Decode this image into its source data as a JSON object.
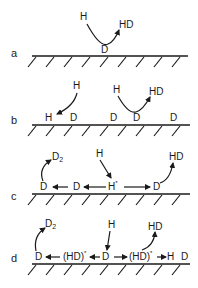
{
  "figure": {
    "panels": [
      {
        "id": "a",
        "label": "a",
        "surface_species": [
          "D"
        ],
        "gas_in": "H",
        "gas_out": "HD"
      },
      {
        "id": "b",
        "label": "b",
        "surface_species": [
          "H",
          "D",
          "D",
          "D",
          "D"
        ],
        "gas_in": [
          "H",
          "H"
        ],
        "gas_out": "HD"
      },
      {
        "id": "c",
        "label": "c",
        "surface_species": [
          "D",
          "D",
          "H",
          "D"
        ],
        "hot_atom": "H*",
        "gas_in": "H",
        "gas_out": [
          "D2",
          "HD"
        ]
      },
      {
        "id": "d",
        "label": "d",
        "surface_species": [
          "D",
          "(HD)*",
          "D",
          "(HD)*",
          "H",
          "D"
        ],
        "gas_in": "H",
        "gas_out": [
          "D2",
          "HD"
        ]
      }
    ],
    "labels": {
      "a": {
        "panel": "a",
        "h": "H",
        "hd": "HD",
        "d": "D"
      },
      "b": {
        "panel": "b",
        "h1": "H",
        "h2": "H",
        "hd": "HD",
        "hs": "H",
        "d1": "D",
        "d2": "D",
        "d3": "D",
        "d4": "D"
      },
      "c": {
        "panel": "c",
        "d2": "D",
        "d2sub": "2",
        "h": "H",
        "hd": "HD",
        "s1": "D",
        "s2": "D",
        "hstar": "H",
        "star": "*",
        "s4": "D"
      },
      "d": {
        "panel": "d",
        "d2": "D",
        "d2sub": "2",
        "h": "H",
        "hd": "HD",
        "s1": "D",
        "s2": "(HD)",
        "star1": "*",
        "s3": "D",
        "s4": "(HD)",
        "star2": "*",
        "s5": "H",
        "s6": "D"
      }
    }
  }
}
